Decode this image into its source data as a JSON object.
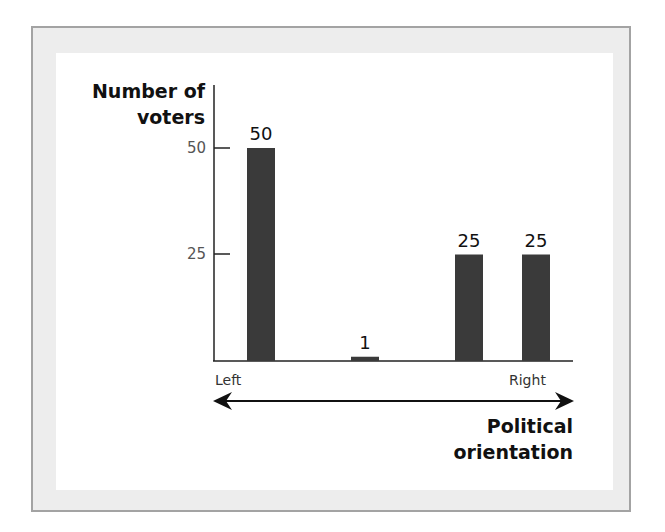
{
  "chart_data": {
    "type": "bar",
    "title": "",
    "xlabel": "Political orientation",
    "ylabel": "Number of voters",
    "ylabel_lines": [
      "Number of",
      "voters"
    ],
    "xlabel_lines": [
      "Political",
      "orientation"
    ],
    "categories": [
      "Bar 1",
      "Bar 2",
      "Bar 3",
      "Bar 4"
    ],
    "values": [
      50,
      1,
      25,
      25
    ],
    "value_labels": [
      "50",
      "1",
      "25",
      "25"
    ],
    "yticks": [
      25,
      50
    ],
    "ytick_labels": [
      "25",
      "50"
    ],
    "ylim": [
      0,
      50
    ],
    "axis_endpoints": {
      "left": "Left",
      "right": "Right"
    },
    "grid": false,
    "legend": null,
    "bar_color": "#3a3a3a"
  }
}
